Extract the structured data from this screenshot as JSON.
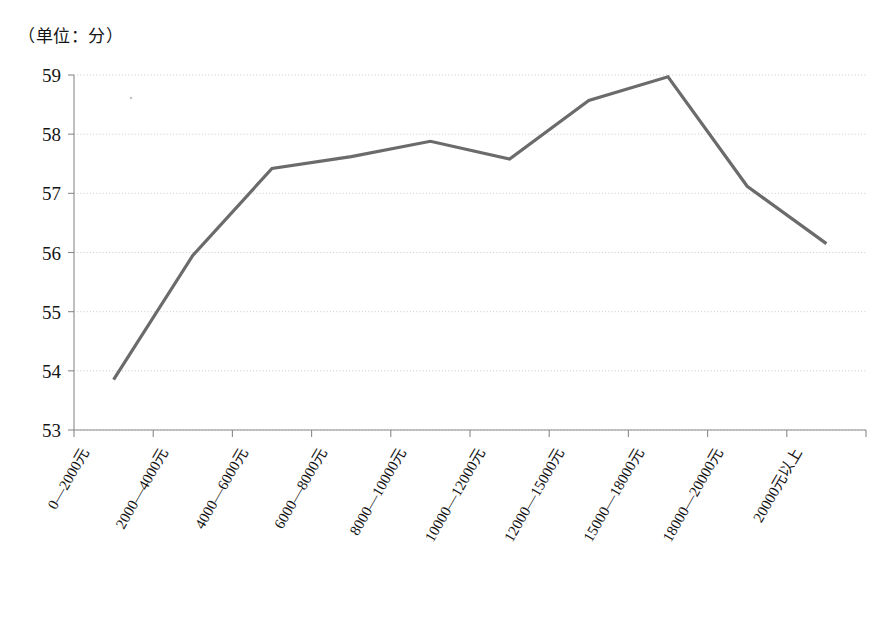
{
  "chart_data": {
    "type": "line",
    "title": "",
    "subtitle": "",
    "unit_note": "（单位：分）",
    "xlabel": "",
    "ylabel": "",
    "ylim": [
      53,
      59
    ],
    "ytick_labels": [
      "59",
      "58",
      "57",
      "56",
      "55",
      "54",
      "53"
    ],
    "ytick_values": [
      59,
      58,
      57,
      56,
      55,
      54,
      53
    ],
    "grid": true,
    "grid_axis": "y",
    "legend": false,
    "legend_position": "none",
    "line_color": "#6b6b6b",
    "grid_color": "#c8c8d0",
    "axis_color": "#8a8a8a",
    "categories": [
      "0—2000元",
      "2000—4000元",
      "4000—6000元",
      "6000—8000元",
      "8000—10000元",
      "10000—12000元",
      "12000—15000元",
      "15000—18000元",
      "18000—20000元",
      "20000元以上"
    ],
    "values": [
      53.85,
      55.95,
      57.42,
      57.62,
      57.88,
      57.58,
      58.57,
      58.97,
      57.12,
      56.15
    ],
    "series": [
      {
        "name": "幸福感得分",
        "values": [
          53.85,
          55.95,
          57.42,
          57.62,
          57.88,
          57.58,
          58.57,
          58.97,
          57.12,
          56.15
        ]
      }
    ]
  },
  "axes": {
    "y": {
      "labels": [
        "59",
        "58",
        "57",
        "56",
        "55",
        "54",
        "53"
      ]
    },
    "x": {
      "labels": [
        "0—2000元",
        "2000—4000元",
        "4000—6000元",
        "6000—8000元",
        "8000—10000元",
        "10000—12000元",
        "12000—15000元",
        "15000—18000元",
        "18000—20000元",
        "20000元以上"
      ]
    }
  },
  "annotations": {
    "unit": "（单位：分）"
  }
}
